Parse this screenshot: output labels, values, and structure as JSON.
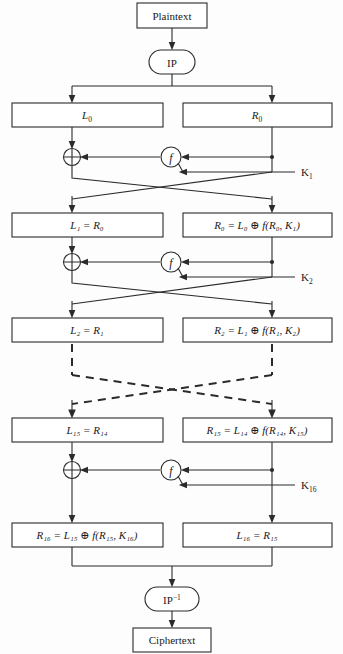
{
  "diagram": {
    "colors": {
      "line": "#2b2b2b",
      "box_fill": "#ffffff",
      "text": "#1a1a1a",
      "background": "#fdfdfd"
    }
  },
  "nodes": {
    "plaintext": {
      "label": "Plaintext",
      "shape": "rect"
    },
    "ip": {
      "label": "IP",
      "shape": "rounded-oval"
    },
    "ip_inverse": {
      "label": "IP",
      "superscript": "-1",
      "shape": "rounded-oval"
    },
    "ciphertext": {
      "label": "Ciphertext",
      "shape": "rect"
    }
  },
  "rounds": [
    {
      "left_box": {
        "base": "L",
        "sub": "0",
        "expr": ""
      },
      "right_box": {
        "base": "R",
        "sub": "0",
        "expr": ""
      },
      "key": {
        "base": "K",
        "sub": "1"
      },
      "fn": "f",
      "xor": "⊕"
    },
    {
      "left_box": {
        "base": "L",
        "sub": "1",
        "expr": "= R",
        "expr_sub": "0"
      },
      "right_box": {
        "base": "R",
        "sub": "0",
        "expr": "= L",
        "expr_sub": "0",
        "fn_args_base": "R",
        "fn_args_sub": "0",
        "fn_key_base": "K",
        "fn_key_sub": "1"
      },
      "key": {
        "base": "K",
        "sub": "2"
      },
      "fn": "f",
      "xor": "⊕"
    },
    {
      "left_box": {
        "base": "L",
        "sub": "2",
        "expr": "= R",
        "expr_sub": "1"
      },
      "right_box": {
        "base": "R",
        "sub": "2",
        "expr": "= L",
        "expr_sub": "1",
        "fn_args_base": "R",
        "fn_args_sub": "1",
        "fn_key_base": "K",
        "fn_key_sub": "2"
      },
      "key": null,
      "fn": null,
      "xor": null
    },
    {
      "left_box": {
        "base": "L",
        "sub": "15",
        "expr": "= R",
        "expr_sub": "14"
      },
      "right_box": {
        "base": "R",
        "sub": "15",
        "expr": "= L",
        "expr_sub": "14",
        "fn_args_base": "R",
        "fn_args_sub": "14",
        "fn_key_base": "K",
        "fn_key_sub": "15"
      },
      "key": {
        "base": "K",
        "sub": "16"
      },
      "fn": "f",
      "xor": "⊕"
    },
    {
      "left_box": {
        "base": "R",
        "sub": "16",
        "expr": "= L",
        "expr_sub": "15",
        "fn_args_base": "R",
        "fn_args_sub": "15",
        "fn_key_base": "K",
        "fn_key_sub": "16"
      },
      "right_box": {
        "base": "L",
        "sub": "16",
        "expr": "= R",
        "expr_sub": "15"
      },
      "key": null,
      "fn": null,
      "xor": null
    }
  ],
  "text": {
    "plaintext": "Plaintext",
    "ciphertext": "Ciphertext",
    "ip": "IP",
    "ip_inv_base": "IP",
    "ip_inv_sup": "−1",
    "f_symbol": "f",
    "xor_symbol": "⊕",
    "L0": "L",
    "L0_sub": "0",
    "R0": "R",
    "R0_sub": "0",
    "K1": "K",
    "K1_sub": "1",
    "K2": "K",
    "K2_sub": "2",
    "K16": "K",
    "K16_sub": "16",
    "row2_left": "L₁ = R₀",
    "row2_right": "R₀ = L₀ ⊕ f(R₀, K₁)",
    "row3_left": "L₂ = R₁",
    "row3_right": "R₂ = L₁ ⊕ f(R₁, K₂)",
    "row4_left": "L₁₅ = R₁₄",
    "row4_right": "R₁₅ = L₁₄ ⊕ f(R₁₄, K₁₅)",
    "row5_left": "R₁₆ = L₁₅ ⊕ f(R₁₅, K₁₆)",
    "row5_right": "L₁₆ = R₁₅"
  }
}
